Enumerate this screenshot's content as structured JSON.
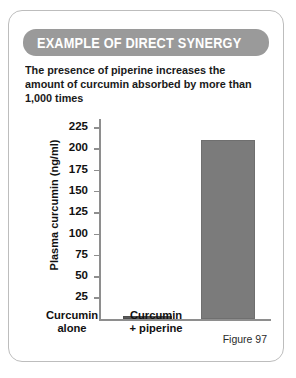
{
  "card": {
    "banner_title": "EXAMPLE OF DIRECT SYNERGY",
    "subtitle": "The presence of piperine increases the amount of curcumin absorbed by more than 1,000 times",
    "figure_caption": "Figure 97"
  },
  "chart_data": {
    "type": "bar",
    "title": "The presence of piperine increases the amount of curcumin absorbed by more than 1,000 times",
    "categories": [
      "Curcumin alone",
      "Curcumin + piperine"
    ],
    "category_lines": [
      [
        "Curcumin",
        "alone"
      ],
      [
        "Curcumin",
        "+ piperine"
      ]
    ],
    "values": [
      3,
      212
    ],
    "xlabel": "",
    "ylabel": "Plasma curcumin (ng/ml)",
    "ylim": [
      0,
      237
    ],
    "yticks": [
      25,
      50,
      75,
      100,
      125,
      150,
      175,
      200,
      225
    ],
    "ytick_labels": [
      "225",
      "200",
      "175",
      "150",
      "125",
      "100",
      "75",
      "50",
      "25"
    ],
    "grid": false,
    "legend": false,
    "bar_color": "#7b7b7b",
    "bar_color_first": "#5a5a5a",
    "axis_color": "#8e8e8e"
  },
  "colors": {
    "banner_bg": "#9a9a9a",
    "banner_text": "#ffffff",
    "card_border": "#bdbdbd",
    "text": "#111111",
    "background": "#ffffff"
  }
}
